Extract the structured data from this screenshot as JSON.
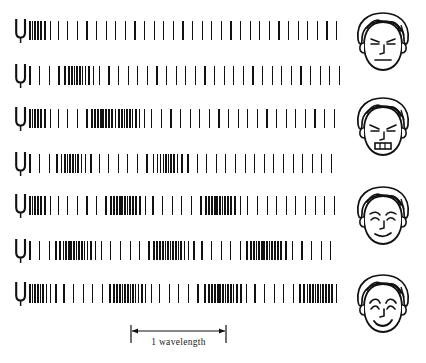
{
  "figure": {
    "type": "physics-wave-diagram",
    "ink_color": "#111111",
    "background_color": "#ffffff",
    "scale_label": "1 wavelength",
    "row_count": 7,
    "face_count": 4
  },
  "chart_data": {
    "type": "diagram",
    "xlabel": "",
    "ylabel": "",
    "annotations": [
      "1 wavelength"
    ],
    "scale_bar": {
      "label": "1 wavelength",
      "x_start": 131,
      "x_end": 226,
      "length_px": 95
    },
    "wave_field": {
      "x_start": 30,
      "x_end": 340,
      "line_pitch_rarefaction": 9.6,
      "line_pitch_compression": 2.6
    },
    "rows": [
      {
        "index": 1,
        "y": 30,
        "fork": true,
        "compressions": [
          30
        ]
      },
      {
        "index": 2,
        "y": 75,
        "fork": true,
        "compressions": [
          76
        ]
      },
      {
        "index": 3,
        "y": 118,
        "fork": true,
        "compressions": [
          30,
          101
        ]
      },
      {
        "index": 4,
        "y": 163,
        "fork": true,
        "compressions": [
          70,
          165
        ]
      },
      {
        "index": 5,
        "y": 205,
        "fork": true,
        "compressions": [
          30,
          120,
          215
        ]
      },
      {
        "index": 6,
        "y": 250,
        "fork": true,
        "compressions": [
          78,
          168,
          258
        ]
      },
      {
        "index": 7,
        "y": 293,
        "fork": true,
        "compressions": [
          30,
          130,
          225,
          312
        ]
      }
    ],
    "faces": [
      {
        "index": 1,
        "y": 48,
        "expression": "neutral",
        "label": "neutral-face"
      },
      {
        "index": 2,
        "y": 133,
        "expression": "grimace",
        "label": "grimacing-face"
      },
      {
        "index": 3,
        "y": 222,
        "expression": "slight-smile",
        "label": "slightly-smiling-face"
      },
      {
        "index": 4,
        "y": 310,
        "expression": "smile",
        "label": "smiling-face"
      }
    ]
  }
}
